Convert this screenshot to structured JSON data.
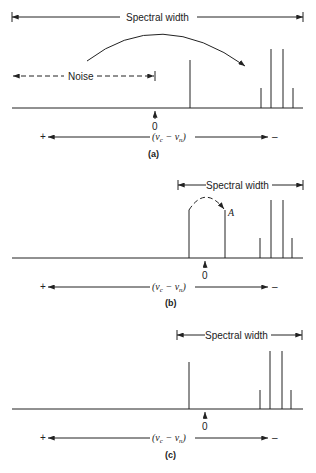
{
  "figure": {
    "panels": [
      {
        "id": "a",
        "caption": "(a)",
        "spectral_width_label": "Spectral width",
        "noise_label": "Noise",
        "zero_label": "0",
        "axis_plus": "+",
        "axis_minus": "–",
        "axis_label": "(ν_c − ν_n)",
        "peaks": [
          {
            "x": 190,
            "top": 60
          },
          {
            "x": 261,
            "top": 88
          },
          {
            "x": 271,
            "top": 49
          },
          {
            "x": 283,
            "top": 49
          },
          {
            "x": 293,
            "top": 88
          }
        ]
      },
      {
        "id": "b",
        "caption": "(b)",
        "spectral_width_label": "Spectral width",
        "peak_label": "A",
        "zero_label": "0",
        "axis_plus": "+",
        "axis_minus": "–",
        "axis_label": "(ν_c − ν_n)",
        "peaks": [
          {
            "x": 189,
            "top": 210
          },
          {
            "x": 225,
            "top": 210
          },
          {
            "x": 260,
            "top": 238
          },
          {
            "x": 271,
            "top": 200
          },
          {
            "x": 283,
            "top": 200
          },
          {
            "x": 292,
            "top": 238
          }
        ]
      },
      {
        "id": "c",
        "caption": "(c)",
        "spectral_width_label": "Spectral width",
        "zero_label": "0",
        "axis_plus": "+",
        "axis_minus": "–",
        "axis_label": "(ν_c − ν_n)",
        "peaks": [
          {
            "x": 189,
            "top": 362
          },
          {
            "x": 260,
            "top": 390
          },
          {
            "x": 270,
            "top": 351
          },
          {
            "x": 282,
            "top": 351
          },
          {
            "x": 291,
            "top": 390
          }
        ]
      }
    ],
    "axis_sub_c": "c",
    "axis_sub_n": "n",
    "nu": "ν",
    "colors": {
      "ink": "#222222",
      "background": "#ffffff"
    }
  }
}
